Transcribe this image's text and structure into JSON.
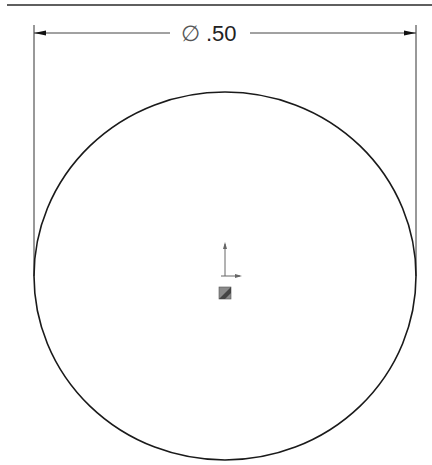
{
  "drawing": {
    "type": "circle-sketch",
    "dimension": {
      "symbol": "∅",
      "value": ".50",
      "label": "∅ .50",
      "kind": "diameter"
    },
    "circle": {
      "center_x": 225,
      "center_y": 276,
      "radius_x": 191,
      "radius_y": 184
    },
    "origin_marker": {
      "x": 225,
      "y": 276
    },
    "colors": {
      "line": "#1a1a1a",
      "dimension_line": "#333333",
      "background": "#ffffff",
      "origin_fill": "#777777"
    }
  }
}
